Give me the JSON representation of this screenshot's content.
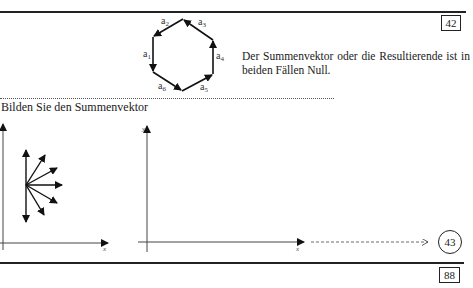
{
  "page": {
    "top_box_number": "42",
    "bottom_box_number": "88",
    "reference_circle": "43"
  },
  "hexagon": {
    "labels": [
      "a1",
      "a2",
      "a3",
      "a4",
      "a5",
      "a6"
    ],
    "label_display": {
      "a1": {
        "base": "a",
        "sub": "1"
      },
      "a2": {
        "base": "a",
        "sub": "2"
      },
      "a3": {
        "base": "a",
        "sub": "3"
      },
      "a4": {
        "base": "a",
        "sub": "4"
      },
      "a5": {
        "base": "a",
        "sub": "5"
      },
      "a6": {
        "base": "a",
        "sub": "6"
      }
    }
  },
  "answer_text": "Der Summenvektor oder die Resultierende ist in beiden Fällen Null.",
  "instruction_text": "Bilden Sie den Summenvektor",
  "diagrams": {
    "left": {
      "x_label": "x"
    },
    "right": {
      "x_label": "x",
      "y_label": "y"
    }
  }
}
